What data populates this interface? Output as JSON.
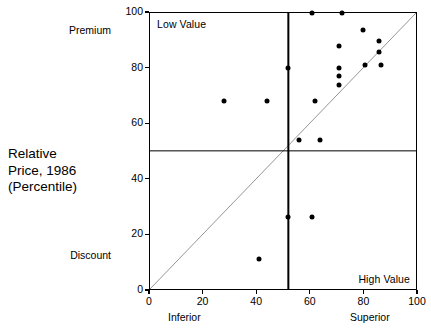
{
  "axis_title": "Relative\nPrice, 1986\n(Percentile)",
  "anchors": {
    "y_high": "Premium",
    "y_low": "Discount",
    "x_low": "Inferior",
    "x_high": "Superior"
  },
  "corner_labels": {
    "top_left": "Low Value",
    "bottom_right": "High Value"
  },
  "chart_data": {
    "type": "scatter",
    "title": "",
    "xlabel": "",
    "ylabel": "Relative Price, 1986 (Percentile)",
    "xlim": [
      0,
      100
    ],
    "ylim": [
      0,
      100
    ],
    "xticks": [
      0,
      20,
      40,
      60,
      80,
      100
    ],
    "yticks": [
      0,
      20,
      40,
      60,
      80,
      100
    ],
    "grid": false,
    "legend": "none",
    "marker": "filled-circle",
    "marker_color": "#000000",
    "reference_lines": [
      {
        "name": "diagonal-parity-line",
        "from": [
          0,
          0
        ],
        "to": [
          100,
          100
        ]
      },
      {
        "name": "quadrant-vertical",
        "x": 52
      },
      {
        "name": "quadrant-horizontal",
        "y": 50
      }
    ],
    "points": [
      {
        "x": 28,
        "y": 68
      },
      {
        "x": 44,
        "y": 68
      },
      {
        "x": 52,
        "y": 80
      },
      {
        "x": 56,
        "y": 54
      },
      {
        "x": 62,
        "y": 68
      },
      {
        "x": 64,
        "y": 54
      },
      {
        "x": 61,
        "y": 100
      },
      {
        "x": 72,
        "y": 100
      },
      {
        "x": 71,
        "y": 88
      },
      {
        "x": 71,
        "y": 80
      },
      {
        "x": 71,
        "y": 77
      },
      {
        "x": 71,
        "y": 74
      },
      {
        "x": 80,
        "y": 94
      },
      {
        "x": 81,
        "y": 81
      },
      {
        "x": 86,
        "y": 90
      },
      {
        "x": 86,
        "y": 86
      },
      {
        "x": 87,
        "y": 81
      },
      {
        "x": 52,
        "y": 26
      },
      {
        "x": 61,
        "y": 26
      },
      {
        "x": 41,
        "y": 11
      }
    ]
  }
}
